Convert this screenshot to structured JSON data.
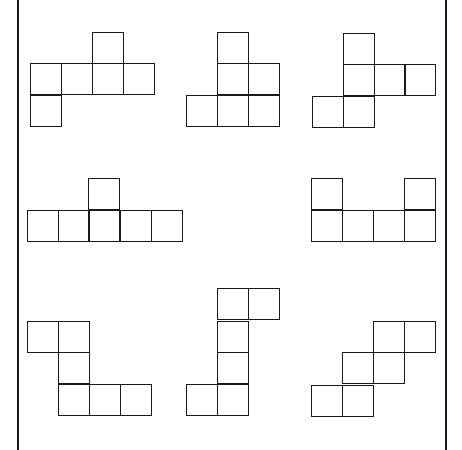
{
  "diagram": {
    "square_size": 31,
    "line_color": "#1a1a1a",
    "background": "#ffffff",
    "border_lines": [
      {
        "x": 17
      },
      {
        "x": 445
      }
    ],
    "nets": [
      {
        "id": 1,
        "squares": [
          [
            92,
            32
          ],
          [
            30,
            63
          ],
          [
            61,
            63
          ],
          [
            92,
            63
          ],
          [
            123,
            63
          ],
          [
            30,
            95
          ]
        ]
      },
      {
        "id": 2,
        "squares": [
          [
            217,
            32
          ],
          [
            217,
            63
          ],
          [
            248,
            63
          ],
          [
            186,
            95
          ],
          [
            217,
            95
          ],
          [
            248,
            95
          ]
        ]
      },
      {
        "id": 3,
        "squares": [
          [
            343,
            33
          ],
          [
            343,
            64
          ],
          [
            374,
            64
          ],
          [
            404,
            64
          ],
          [
            312,
            96
          ],
          [
            343,
            96
          ]
        ]
      },
      {
        "id": 4,
        "squares": [
          [
            88,
            178
          ],
          [
            27,
            210
          ],
          [
            58,
            210
          ],
          [
            88,
            210
          ],
          [
            120,
            210
          ],
          [
            151,
            210
          ]
        ]
      },
      {
        "id": 5,
        "squares": [
          [
            311,
            178
          ],
          [
            404,
            178
          ],
          [
            311,
            210
          ],
          [
            342,
            210
          ],
          [
            373,
            210
          ],
          [
            404,
            210
          ]
        ]
      },
      {
        "id": 6,
        "squares": [
          [
            27,
            321
          ],
          [
            58,
            321
          ],
          [
            58,
            352
          ],
          [
            58,
            384
          ],
          [
            89,
            384
          ],
          [
            120,
            384
          ]
        ]
      },
      {
        "id": 7,
        "squares": [
          [
            217,
            288
          ],
          [
            248,
            288
          ],
          [
            217,
            321
          ],
          [
            217,
            352
          ],
          [
            186,
            384
          ],
          [
            217,
            384
          ]
        ]
      },
      {
        "id": 8,
        "squares": [
          [
            373,
            321
          ],
          [
            404,
            321
          ],
          [
            342,
            352
          ],
          [
            373,
            352
          ],
          [
            311,
            385
          ],
          [
            342,
            385
          ]
        ]
      }
    ]
  }
}
